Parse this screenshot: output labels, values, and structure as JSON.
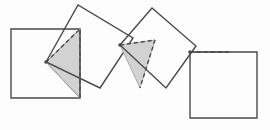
{
  "figure": {
    "canvas": {
      "width": 270,
      "height": 130
    },
    "colors": {
      "background": "#fdfdfd",
      "stroke": "#4a4a4a",
      "shade_fill": "#d2d2d2",
      "shade_stroke": "#8a8a8a",
      "dashed_stroke": "#4a4a4a",
      "thin_stroke": "#9a9a9a"
    },
    "stroke_widths": {
      "square": 1.4,
      "dashed": 1.4,
      "thin": 1.0
    },
    "dash_pattern": "4,3",
    "shapes": [
      {
        "id": "square-1",
        "kind": "square",
        "orientation": "axis-aligned",
        "rotation_deg": 0,
        "points": "11,29 80,29 80,98 11,98"
      },
      {
        "id": "square-2",
        "kind": "square",
        "orientation": "rotated",
        "rotation_deg": 30,
        "points": "46,62 78,5 133,38 100,88"
      },
      {
        "id": "square-3",
        "kind": "square",
        "orientation": "rotated",
        "rotation_deg": -40,
        "points": "120,45 152,8 196,46 166,88"
      },
      {
        "id": "square-4",
        "kind": "square",
        "orientation": "axis-aligned",
        "rotation_deg": 0,
        "points": "190,52 257,52 257,118 190,118"
      }
    ],
    "shaded_regions": [
      {
        "id": "shade-1",
        "kind": "triangle",
        "points": "46,62 80,29 80,98"
      },
      {
        "id": "shade-2",
        "kind": "triangle",
        "points": "120,45 155,40 140,88"
      },
      {
        "id": "shade-3",
        "kind": "triangle",
        "points": "190,52 190,52 229,52"
      }
    ],
    "dashed_edges": [
      {
        "id": "dash-1",
        "points": "46,62 80,29 80,98"
      },
      {
        "id": "dash-2",
        "points": "120,45 155,40"
      },
      {
        "id": "dash-3",
        "points": "155,40 140,88"
      },
      {
        "id": "dash-4",
        "points": "190,52 229,52"
      }
    ],
    "thin_edges": [
      {
        "id": "thin-1",
        "points": "46,62 80,98"
      },
      {
        "id": "thin-2",
        "points": "46,62 80,29"
      }
    ],
    "pivot_points": [
      {
        "id": "pivot-1",
        "x": 46,
        "y": 62
      },
      {
        "id": "pivot-2",
        "x": 120,
        "y": 45
      },
      {
        "id": "pivot-3",
        "x": 190,
        "y": 52
      }
    ]
  }
}
